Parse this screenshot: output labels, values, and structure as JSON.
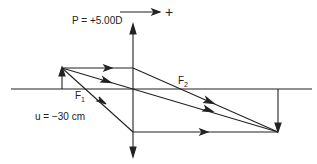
{
  "labels": {
    "power": "P = +5.00D",
    "direction_sign": "+",
    "f1_main": "F",
    "f1_sub": "1",
    "f2_main": "F",
    "f2_sub": "2",
    "object_distance": "u = −30 cm"
  },
  "colors": {
    "stroke": "#222222",
    "background": "#ffffff"
  },
  "geometry": {
    "axis_y": 89,
    "lens_x": 133,
    "object_x": 62,
    "object_top_y": 68,
    "image_x": 278,
    "image_bottom_y": 132,
    "f1_x": 83,
    "f2_x": 183
  }
}
